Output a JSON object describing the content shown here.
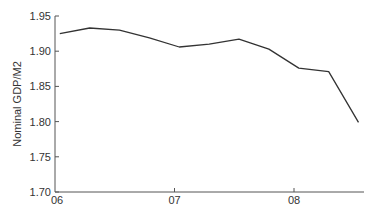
{
  "chart_data": {
    "type": "line",
    "title": "",
    "xlabel": "",
    "ylabel": "Nominal GDP/M2",
    "ylim": [
      1.7,
      1.95
    ],
    "yticks": [
      "1.95",
      "1.90",
      "1.85",
      "1.80",
      "1.75",
      "1.70"
    ],
    "xticks": [
      "06",
      "07",
      "08"
    ],
    "grid": false,
    "legend": null,
    "x": [
      2006.04,
      2006.29,
      2006.54,
      2006.79,
      2007.04,
      2007.29,
      2007.54,
      2007.79,
      2008.04,
      2008.29,
      2008.54
    ],
    "series": [
      {
        "name": "Nominal GDP/M2",
        "color": "#333333",
        "values": [
          1.925,
          1.933,
          1.93,
          1.919,
          1.906,
          1.91,
          1.917,
          1.903,
          1.876,
          1.871,
          1.799
        ]
      }
    ]
  }
}
